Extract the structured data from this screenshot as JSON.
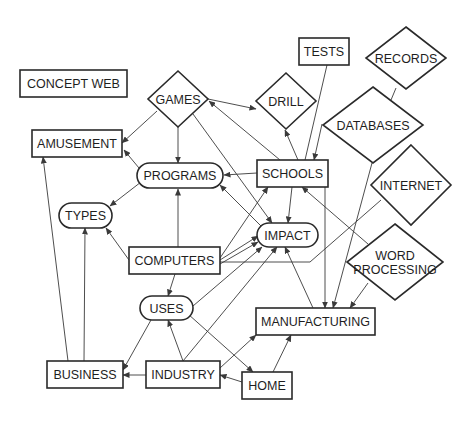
{
  "diagram": {
    "title": "CONCEPT WEB",
    "nodes": [
      {
        "id": "concept_web",
        "label": "CONCEPT WEB",
        "shape": "rect",
        "x": 20,
        "y": 70,
        "w": 107,
        "h": 27
      },
      {
        "id": "games",
        "label": "GAMES",
        "shape": "diamond",
        "cx": 178,
        "cy": 99,
        "rx": 30,
        "ry": 28
      },
      {
        "id": "amusement",
        "label": "AMUSEMENT",
        "shape": "rect",
        "x": 32,
        "y": 130,
        "w": 90,
        "h": 27
      },
      {
        "id": "programs",
        "label": "PROGRAMS",
        "shape": "pill",
        "x": 137,
        "y": 163,
        "w": 86,
        "h": 25
      },
      {
        "id": "types",
        "label": "TYPES",
        "shape": "pill",
        "x": 59,
        "y": 203,
        "w": 53,
        "h": 25
      },
      {
        "id": "tests",
        "label": "TESTS",
        "shape": "rect",
        "x": 299,
        "y": 38,
        "w": 50,
        "h": 27
      },
      {
        "id": "records",
        "label": "RECORDS",
        "shape": "diamond",
        "cx": 406,
        "cy": 58,
        "rx": 40,
        "ry": 31
      },
      {
        "id": "drill",
        "label": "DRILL",
        "shape": "diamond",
        "cx": 286,
        "cy": 101,
        "rx": 30,
        "ry": 28
      },
      {
        "id": "databases",
        "label": "DATABASES",
        "shape": "diamond",
        "cx": 373,
        "cy": 125,
        "rx": 50,
        "ry": 38
      },
      {
        "id": "schools",
        "label": "SCHOOLS",
        "shape": "rect",
        "x": 257,
        "y": 160,
        "w": 71,
        "h": 27
      },
      {
        "id": "internet",
        "label": "INTERNET",
        "shape": "diamond",
        "cx": 411,
        "cy": 185,
        "rx": 40,
        "ry": 40
      },
      {
        "id": "computers",
        "label": "COMPUTERS",
        "shape": "rect",
        "x": 129,
        "y": 247,
        "w": 91,
        "h": 27
      },
      {
        "id": "impact",
        "label": "IMPACT",
        "shape": "pill",
        "x": 257,
        "y": 223,
        "w": 61,
        "h": 24
      },
      {
        "id": "word_processing",
        "label": "WORD PROCESSING",
        "lines": [
          "WORD",
          "PROCESSING"
        ],
        "shape": "diamond",
        "cx": 395,
        "cy": 262,
        "rx": 48,
        "ry": 38
      },
      {
        "id": "uses",
        "label": "USES",
        "shape": "pill",
        "x": 140,
        "y": 296,
        "w": 53,
        "h": 24
      },
      {
        "id": "manufacturing",
        "label": "MANUFACTURING",
        "shape": "rect",
        "x": 256,
        "y": 308,
        "w": 119,
        "h": 27
      },
      {
        "id": "business",
        "label": "BUSINESS",
        "shape": "rect",
        "x": 47,
        "y": 361,
        "w": 76,
        "h": 27
      },
      {
        "id": "industry",
        "label": "INDUSTRY",
        "shape": "rect",
        "x": 146,
        "y": 361,
        "w": 74,
        "h": 27
      },
      {
        "id": "home",
        "label": "HOME",
        "shape": "rect",
        "x": 242,
        "y": 372,
        "w": 50,
        "h": 27
      }
    ],
    "edges": [
      {
        "from": "games",
        "to": "amusement",
        "points": [
          [
            157,
            111
          ],
          [
            122,
            143
          ]
        ],
        "arrow": "end"
      },
      {
        "from": "games",
        "to": "programs",
        "points": [
          [
            178,
            127
          ],
          [
            178,
            163
          ]
        ],
        "arrow": "end"
      },
      {
        "from": "games",
        "to": "impact",
        "points": [
          [
            193,
            114
          ],
          [
            272,
            223
          ]
        ],
        "arrow": "end"
      },
      {
        "from": "games",
        "to": "drill",
        "points": [
          [
            208,
            99
          ],
          [
            256,
            109
          ]
        ],
        "arrow": "end"
      },
      {
        "from": "schools",
        "to": "games",
        "points": [
          [
            280,
            160
          ],
          [
            209,
            101
          ]
        ],
        "arrow": "end"
      },
      {
        "from": "programs",
        "to": "amusement",
        "points": [
          [
            139,
            168
          ],
          [
            124,
            150
          ]
        ],
        "arrow": "end"
      },
      {
        "from": "programs",
        "to": "types",
        "points": [
          [
            141,
            182
          ],
          [
            110,
            206
          ]
        ],
        "arrow": "end"
      },
      {
        "from": "schools",
        "to": "programs",
        "points": [
          [
            257,
            173
          ],
          [
            224,
            175
          ]
        ],
        "arrow": "end"
      },
      {
        "from": "impact",
        "to": "programs",
        "points": [
          [
            262,
            227
          ],
          [
            220,
            185
          ]
        ],
        "arrow": "end"
      },
      {
        "from": "schools",
        "to": "drill",
        "points": [
          [
            298,
            160
          ],
          [
            285,
            130
          ]
        ],
        "arrow": "end"
      },
      {
        "from": "tests",
        "to": "schools",
        "points": [
          [
            327,
            65
          ],
          [
            305,
            160
          ]
        ],
        "arrow": "none"
      },
      {
        "from": "records",
        "to": "databases",
        "points": [
          [
            396,
            88
          ],
          [
            391,
            100
          ]
        ],
        "arrow": "none"
      },
      {
        "from": "databases",
        "to": "schools",
        "points": [
          [
            322,
            124
          ],
          [
            314,
            160
          ]
        ],
        "arrow": "end"
      },
      {
        "from": "schools",
        "to": "impact",
        "points": [
          [
            292,
            187
          ],
          [
            288,
            223
          ]
        ],
        "arrow": "end"
      },
      {
        "from": "computers",
        "to": "programs",
        "points": [
          [
            178,
            247
          ],
          [
            178,
            189
          ]
        ],
        "arrow": "end"
      },
      {
        "from": "computers",
        "to": "types",
        "points": [
          [
            129,
            260
          ],
          [
            106,
            228
          ]
        ],
        "arrow": "end"
      },
      {
        "from": "computers",
        "to": "schools",
        "points": [
          [
            220,
            258
          ],
          [
            268,
            187
          ]
        ],
        "arrow": "end"
      },
      {
        "from": "computers",
        "to": "impact",
        "points": [
          [
            220,
            260
          ],
          [
            258,
            236
          ]
        ],
        "arrow": "end"
      },
      {
        "from": "computers",
        "to": "impact",
        "points": [
          [
            220,
            264
          ],
          [
            258,
            242
          ]
        ],
        "arrow": "end"
      },
      {
        "from": "computers",
        "to": "uses",
        "points": [
          [
            175,
            274
          ],
          [
            168,
            296
          ]
        ],
        "arrow": "end"
      },
      {
        "from": "internet",
        "to": "computers",
        "points": [
          [
            381,
            200
          ],
          [
            310,
            262
          ],
          [
            220,
            262
          ]
        ],
        "arrow": "none"
      },
      {
        "from": "word_processing",
        "to": "schools",
        "points": [
          [
            368,
            244
          ],
          [
            302,
            187
          ]
        ],
        "arrow": "end"
      },
      {
        "from": "uses",
        "to": "impact",
        "points": [
          [
            193,
            306
          ],
          [
            262,
            247
          ]
        ],
        "arrow": "end"
      },
      {
        "from": "uses",
        "to": "business",
        "points": [
          [
            151,
            320
          ],
          [
            123,
            370
          ]
        ],
        "arrow": "end"
      },
      {
        "from": "uses",
        "to": "home",
        "points": [
          [
            188,
            314
          ],
          [
            253,
            372
          ]
        ],
        "arrow": "end"
      },
      {
        "from": "industry",
        "to": "uses",
        "points": [
          [
            183,
            361
          ],
          [
            168,
            320
          ]
        ],
        "arrow": "end"
      },
      {
        "from": "industry",
        "to": "business",
        "points": [
          [
            146,
            375
          ],
          [
            123,
            375
          ]
        ],
        "arrow": "end"
      },
      {
        "from": "industry",
        "to": "impact",
        "points": [
          [
            183,
            361
          ],
          [
            277,
            247
          ]
        ],
        "arrow": "end"
      },
      {
        "from": "industry",
        "to": "manufacturing",
        "points": [
          [
            220,
            368
          ],
          [
            256,
            335
          ]
        ],
        "arrow": "end"
      },
      {
        "from": "home",
        "to": "industry",
        "points": [
          [
            242,
            382
          ],
          [
            220,
            375
          ]
        ],
        "arrow": "end"
      },
      {
        "from": "home",
        "to": "manufacturing",
        "points": [
          [
            273,
            372
          ],
          [
            291,
            335
          ]
        ],
        "arrow": "end"
      },
      {
        "from": "manufacturing",
        "to": "impact",
        "points": [
          [
            313,
            308
          ],
          [
            285,
            247
          ]
        ],
        "arrow": "end"
      },
      {
        "from": "schools",
        "to": "manufacturing",
        "points": [
          [
            325,
            187
          ],
          [
            325,
            308
          ]
        ],
        "arrow": "end"
      },
      {
        "from": "databases",
        "to": "manufacturing",
        "points": [
          [
            372,
            163
          ],
          [
            333,
            308
          ]
        ],
        "arrow": "end"
      },
      {
        "from": "word_processing",
        "to": "manufacturing",
        "points": [
          [
            368,
            283
          ],
          [
            350,
            308
          ]
        ],
        "arrow": "end"
      },
      {
        "from": "business",
        "to": "amusement",
        "points": [
          [
            68,
            361
          ],
          [
            43,
            157
          ]
        ],
        "arrow": "end"
      },
      {
        "from": "business",
        "to": "types",
        "points": [
          [
            84,
            361
          ],
          [
            85,
            228
          ]
        ],
        "arrow": "end"
      }
    ]
  },
  "colors": {
    "stroke": "#2a2a2a",
    "edge": "#3a3a3a",
    "text": "#1e1e1e",
    "background": "#ffffff"
  }
}
